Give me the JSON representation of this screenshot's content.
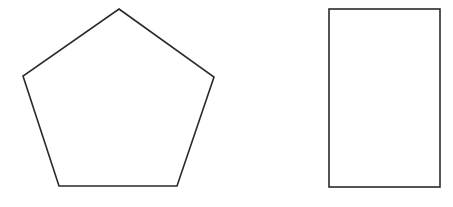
{
  "canvas": {
    "width": 453,
    "height": 207,
    "background": "#ffffff"
  },
  "shapes": [
    {
      "type": "pentagon",
      "stroke": "#2a2a2a",
      "fill": "#ffffff",
      "points": [
        [
          119,
          9
        ],
        [
          214,
          77
        ],
        [
          177,
          186
        ],
        [
          59,
          186
        ],
        [
          23,
          76
        ]
      ]
    },
    {
      "type": "rectangle",
      "stroke": "#2a2a2a",
      "fill": "#ffffff",
      "x": 329,
      "y": 9,
      "width": 111,
      "height": 178
    }
  ]
}
